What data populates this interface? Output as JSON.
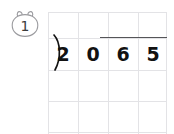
{
  "worksheet": {
    "problem_number": "1",
    "badge_icon": "bear-head-outline",
    "grid": {
      "columns": 4,
      "rows": 4,
      "cell_width": 30,
      "cell_height": 31,
      "line_color": "#e3e3e6",
      "visible": true
    },
    "division": {
      "type": "long-division",
      "divisor": "20",
      "dividend": "65",
      "divisor_digits": [
        "2",
        "0"
      ],
      "dividend_digits": [
        "6",
        "5"
      ],
      "bracket_symbol": ")",
      "quotient": "",
      "digit_color": "#121212",
      "vinculum_color": "#555558"
    }
  }
}
